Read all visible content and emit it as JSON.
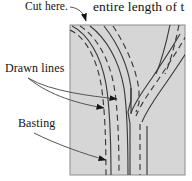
{
  "figure": {
    "panel": {
      "name": "fabric-panel",
      "fill_color": "#d6d6d6",
      "border_color": "#8c8c8c",
      "x": 70,
      "y": 25,
      "width": 115,
      "height": 150
    },
    "colors": {
      "ink": "#141414",
      "fabric": "#d6d6d6",
      "fabric_border": "#8c8c8c",
      "stitch_line": "#3a3a3a",
      "leader_line": "#555555"
    }
  },
  "labels": {
    "cut_here": "Cut here.",
    "drawn_lines": "Drawn lines",
    "basting": "Basting",
    "body_text": "entire length of t"
  },
  "annotations": [
    {
      "label": "Cut here.",
      "target": "top-left-corner",
      "arrow": "down-right"
    },
    {
      "label": "Drawn lines",
      "target": "solid-seam-line-upper",
      "arrow": "right"
    },
    {
      "label": "Drawn lines",
      "target": "solid-seam-line-lower",
      "arrow": "right"
    },
    {
      "label": "Basting",
      "target": "dashed-basting-line",
      "arrow": "right"
    }
  ],
  "line_types": {
    "solid": "drawn line",
    "dashed": "basting stitch"
  }
}
